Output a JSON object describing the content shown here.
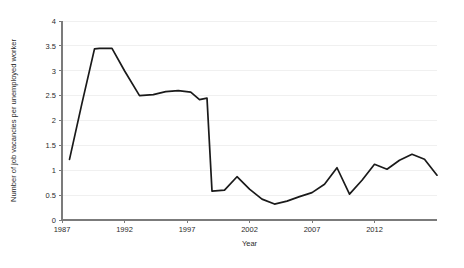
{
  "chart_data": {
    "type": "line",
    "title": "",
    "xlabel": "Year",
    "ylabel": "Number of job vacancies per unemployed worker",
    "xlim": [
      1987,
      2017
    ],
    "ylim": [
      0,
      4
    ],
    "grid": true,
    "legend": "none",
    "xticks": [
      1987,
      1992,
      1997,
      2002,
      2007,
      2012
    ],
    "xtick_labels": [
      "1987",
      "1992",
      "1997",
      "2002",
      "2007",
      "2012"
    ],
    "yticks": [
      0,
      0.5,
      1,
      1.5,
      2,
      2.5,
      3,
      3.5,
      4
    ],
    "ytick_labels": [
      "0",
      "0.5",
      "1",
      "1.5",
      "2",
      "2.5",
      "3",
      "3.5",
      "4"
    ],
    "series": [
      {
        "name": "Job vacancies per unemployed worker",
        "color": "#1a1a1a",
        "x": [
          1987.6,
          1988.6,
          1989.6,
          1990.0,
          1991.0,
          1992.0,
          1993.2,
          1994.3,
          1995.3,
          1996.3,
          1997.3,
          1998.0,
          1998.6,
          1999.0,
          2000.0,
          2001.0,
          2002.0,
          2003.0,
          2004.0,
          2005.0,
          2006.0,
          2007.0,
          2008.0,
          2009.0,
          2010.0,
          2011.0,
          2012.0,
          2013.0,
          2014.0,
          2015.0,
          2016.0,
          2017.0
        ],
        "y": [
          1.22,
          2.35,
          3.44,
          3.45,
          3.45,
          3.0,
          2.5,
          2.52,
          2.58,
          2.6,
          2.57,
          2.42,
          2.45,
          0.58,
          0.6,
          0.87,
          0.62,
          0.42,
          0.32,
          0.38,
          0.47,
          0.55,
          0.72,
          1.05,
          0.52,
          0.8,
          1.12,
          1.02,
          1.2,
          1.32,
          1.22,
          0.9
        ]
      }
    ]
  },
  "figure": {
    "background_color": "#ffffff",
    "line_color": "#1a1a1a",
    "grid_color": "#ececec",
    "axis_color": "#7b7b7b",
    "text_color": "#2b2b2b"
  }
}
